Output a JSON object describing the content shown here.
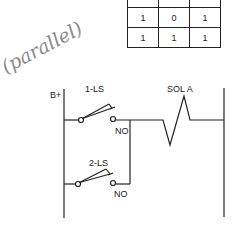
{
  "truth_table": {
    "rows": [
      [
        "",
        "",
        ""
      ],
      [
        "1",
        "0",
        "1"
      ],
      [
        "1",
        "1",
        "1"
      ]
    ]
  },
  "annotation": {
    "handwritten_note": "(parallel)"
  },
  "circuit": {
    "supply_label": "B+",
    "switch_1": {
      "label": "1-LS",
      "contact_label": "NO"
    },
    "switch_2": {
      "label": "2-LS",
      "contact_label": "NO"
    },
    "load_label": "SOL A"
  },
  "colors": {
    "ink": "#222222",
    "pencil": "#8a8a8a"
  }
}
